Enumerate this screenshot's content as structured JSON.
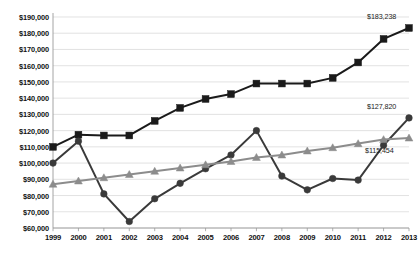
{
  "chart_data": {
    "type": "line",
    "title": "",
    "xlabel": "",
    "ylabel": "",
    "grid": true,
    "legend": "none",
    "ylim": [
      60000,
      190000
    ],
    "ytick_step": 10000,
    "categories": [
      "1999",
      "2000",
      "2001",
      "2002",
      "2003",
      "2004",
      "2005",
      "2006",
      "2007",
      "2008",
      "2009",
      "2010",
      "2011",
      "2012",
      "2013"
    ],
    "ytick_labels": [
      "$190,000",
      "$180,000",
      "$170,000",
      "$160,000",
      "$150,000",
      "$140,000",
      "$130,000",
      "$120,000",
      "$110,000",
      "$100,000",
      "$90,000",
      "$80,000",
      "$70,000",
      "$60,000"
    ],
    "ytick_values": [
      190000,
      180000,
      170000,
      160000,
      150000,
      140000,
      130000,
      120000,
      110000,
      100000,
      90000,
      80000,
      70000,
      60000
    ],
    "series": [
      {
        "name": "series-squares",
        "marker": "square",
        "color": "#1a1a1a",
        "values": [
          110000,
          117500,
          117000,
          117000,
          126000,
          134000,
          139500,
          142500,
          149000,
          149000,
          149000,
          152500,
          162000,
          176500,
          183238
        ],
        "end_label": "$183,238"
      },
      {
        "name": "series-circles",
        "marker": "circle",
        "color": "#3a3a3a",
        "values": [
          100000,
          113500,
          81000,
          64000,
          78000,
          87500,
          96500,
          105000,
          120000,
          92000,
          83500,
          90500,
          89500,
          111000,
          127820
        ],
        "end_label": "$127,820"
      },
      {
        "name": "series-triangles",
        "marker": "triangle",
        "color": "#8c8c8c",
        "values": [
          87000,
          89000,
          91000,
          93000,
          95000,
          97000,
          99000,
          101000,
          103500,
          105000,
          107500,
          109500,
          112000,
          114500,
          115454
        ],
        "end_label": "$115,454"
      }
    ],
    "annotations": [
      {
        "text": "$183,238",
        "series": "series-squares"
      },
      {
        "text": "$127,820",
        "series": "series-circles"
      },
      {
        "text": "$115,454",
        "series": "series-triangles"
      }
    ]
  }
}
